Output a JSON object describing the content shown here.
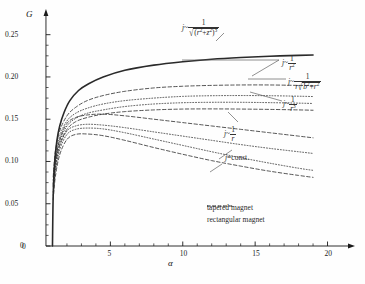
{
  "chart_data": {
    "type": "line",
    "title": "",
    "xlabel": "α",
    "ylabel": "G",
    "xlim": [
      0,
      21
    ],
    "ylim": [
      0,
      0.265
    ],
    "grid": false,
    "xticks": [
      0,
      5,
      10,
      15,
      20
    ],
    "xtick_labels": [
      "0",
      "5",
      "10",
      "15",
      "20"
    ],
    "yticks": [
      0,
      0.05,
      0.1,
      0.15,
      0.2,
      0.25
    ],
    "ytick_labels": [
      "0",
      "0.05",
      "0.10",
      "0.15",
      "0.20",
      "0.25"
    ],
    "legend_position": "bottom-center",
    "legend": [
      {
        "label": "tapered magnet",
        "style": "dashed"
      },
      {
        "label": "rectangular magnet",
        "style": "dotted"
      }
    ],
    "series": [
      {
        "name": "j ~ 1/sqrt((r^2+z^2)^3) , tapered",
        "style": "solid",
        "width": 1.6,
        "x": [
          1.0,
          1.05,
          1.15,
          1.3,
          1.5,
          1.8,
          2.2,
          2.8,
          3.5,
          4.5,
          6.0,
          8.0,
          10.0,
          12.0,
          14.0,
          16.0,
          18.0,
          19.0
        ],
        "y": [
          0.0,
          0.06,
          0.098,
          0.124,
          0.142,
          0.158,
          0.172,
          0.184,
          0.192,
          0.2,
          0.208,
          0.214,
          0.218,
          0.221,
          0.223,
          0.2245,
          0.2255,
          0.226
        ]
      },
      {
        "name": "j ~ 1/r^2 , tapered",
        "style": "dashed",
        "width": 0.8,
        "x": [
          1.05,
          1.2,
          1.5,
          2.0,
          2.6,
          3.4,
          4.5,
          6.0,
          8.0,
          10.0,
          12.0,
          14.0,
          16.0,
          18.0,
          19.0
        ],
        "y": [
          0.082,
          0.112,
          0.136,
          0.154,
          0.164,
          0.172,
          0.178,
          0.183,
          0.187,
          0.189,
          0.19,
          0.1905,
          0.1905,
          0.19,
          0.1898
        ]
      },
      {
        "name": "j ~ 1/(r sqrt(b^2+r^2)) , rectangular",
        "style": "dotted",
        "width": 0.8,
        "x": [
          1.05,
          1.2,
          1.5,
          2.0,
          2.6,
          3.4,
          4.5,
          6.0,
          8.0,
          10.0,
          12.0,
          14.0,
          16.0,
          18.0,
          19.0
        ],
        "y": [
          0.078,
          0.106,
          0.13,
          0.148,
          0.157,
          0.163,
          0.168,
          0.172,
          0.175,
          0.177,
          0.1778,
          0.178,
          0.1778,
          0.1772,
          0.1768
        ]
      },
      {
        "name": "j ~ 1/r^2 , rectangular",
        "style": "dotted",
        "width": 0.8,
        "x": [
          1.05,
          1.2,
          1.5,
          2.0,
          2.6,
          3.4,
          4.5,
          6.0,
          8.0,
          10.0,
          12.0,
          14.0,
          16.0,
          18.0,
          19.0
        ],
        "y": [
          0.074,
          0.101,
          0.124,
          0.142,
          0.151,
          0.157,
          0.161,
          0.165,
          0.168,
          0.1695,
          0.17,
          0.17,
          0.1696,
          0.169,
          0.1686
        ]
      },
      {
        "name": "j ~ 1/r^3 , tapered",
        "style": "dashed",
        "width": 0.8,
        "x": [
          1.05,
          1.2,
          1.5,
          2.0,
          2.6,
          3.4,
          4.5,
          6.0,
          8.0,
          10.0,
          12.0,
          14.0,
          16.0,
          18.0,
          19.0
        ],
        "y": [
          0.07,
          0.096,
          0.12,
          0.138,
          0.147,
          0.152,
          0.156,
          0.159,
          0.161,
          0.162,
          0.1622,
          0.162,
          0.1616,
          0.161,
          0.1606
        ]
      },
      {
        "name": "j ~ 1/r , tapered",
        "style": "dashed",
        "width": 0.8,
        "x": [
          1.05,
          1.2,
          1.5,
          2.0,
          2.6,
          3.4,
          4.5,
          6.0,
          8.0,
          10.0,
          12.0,
          14.0,
          16.0,
          18.0,
          19.0
        ],
        "y": [
          0.072,
          0.1,
          0.126,
          0.145,
          0.152,
          0.155,
          0.156,
          0.154,
          0.15,
          0.146,
          0.142,
          0.138,
          0.134,
          0.13,
          0.128
        ]
      },
      {
        "name": "j ~ 1/r , rectangular",
        "style": "dotted",
        "width": 0.8,
        "x": [
          1.05,
          1.2,
          1.5,
          2.0,
          2.6,
          3.4,
          4.5,
          6.0,
          8.0,
          10.0,
          12.0,
          14.0,
          16.0,
          18.0,
          19.0
        ],
        "y": [
          0.064,
          0.092,
          0.118,
          0.136,
          0.142,
          0.144,
          0.143,
          0.14,
          0.135,
          0.13,
          0.125,
          0.12,
          0.1155,
          0.1115,
          0.1095
        ]
      },
      {
        "name": "j = const. , rectangular",
        "style": "dotted",
        "width": 0.8,
        "x": [
          1.05,
          1.2,
          1.5,
          2.0,
          2.6,
          3.4,
          4.5,
          6.0,
          8.0,
          10.0,
          12.0,
          14.0,
          16.0,
          18.0,
          19.0
        ],
        "y": [
          0.06,
          0.088,
          0.114,
          0.132,
          0.138,
          0.1395,
          0.1385,
          0.134,
          0.1265,
          0.119,
          0.1115,
          0.1045,
          0.098,
          0.092,
          0.0895
        ]
      },
      {
        "name": "j = const. , tapered",
        "style": "dashed",
        "width": 0.8,
        "x": [
          1.05,
          1.2,
          1.5,
          2.0,
          2.6,
          3.4,
          4.5,
          6.0,
          8.0,
          10.0,
          12.0,
          14.0,
          16.0,
          18.0,
          19.0
        ],
        "y": [
          0.055,
          0.082,
          0.108,
          0.126,
          0.132,
          0.1325,
          0.1305,
          0.125,
          0.1165,
          0.1085,
          0.101,
          0.0945,
          0.0885,
          0.0835,
          0.0812
        ]
      }
    ],
    "annotations": [
      {
        "id": "ann-inv-sqrt-r2z2-cubed",
        "text": "j ~ 1/√((r²+z²)³)",
        "kind": "formula"
      },
      {
        "id": "ann-inv-r2",
        "text": "j ~ 1/r²",
        "kind": "formula"
      },
      {
        "id": "ann-inv-r-sqrt-b2r2",
        "text": "j ~ 1/(r√(b²+r²))",
        "kind": "formula"
      },
      {
        "id": "ann-inv-r3",
        "text": "j ~ 1/r³",
        "kind": "formula"
      },
      {
        "id": "ann-inv-r",
        "text": "j ~ 1/r",
        "kind": "formula"
      },
      {
        "id": "ann-const",
        "text": "j = const.",
        "kind": "formula"
      }
    ]
  },
  "labels": {
    "y_axis": "G",
    "x_axis": "α",
    "j": "j",
    "tilde": "~",
    "eq": "=",
    "one": "1",
    "const": "const.",
    "r": "r",
    "b": "b",
    "z": "z",
    "sup2": "2",
    "sup3": "3",
    "radical": "√",
    "paren_open": "(",
    "paren_close": ")",
    "plus": "+"
  },
  "legend": {
    "tapered": "tapered magnet",
    "rectangular": "rectangular magnet"
  },
  "colors": {
    "axis": "#1a1a1a",
    "curve": "#2a2a2a",
    "background": "#fefefe",
    "text": "#1a1a1a"
  }
}
